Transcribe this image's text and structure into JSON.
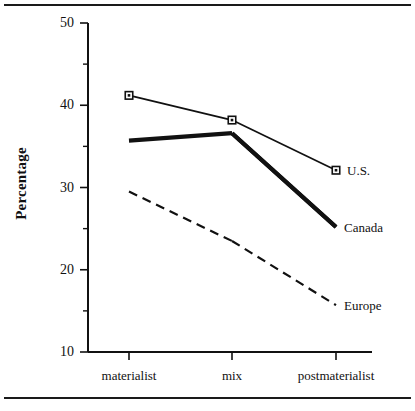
{
  "chart_data": {
    "type": "line",
    "title": "",
    "subtitle": "",
    "xlabel": "",
    "ylabel": "Percentage",
    "categories": [
      "materialist",
      "mix",
      "postmaterialist"
    ],
    "ylim": [
      10,
      50
    ],
    "yticks": [
      10,
      20,
      30,
      40,
      50
    ],
    "ytick_labels": [
      "10",
      "20",
      "30",
      "40",
      "50"
    ],
    "yminor_ticks": [
      15,
      25,
      35,
      45
    ],
    "grid": false,
    "legend_position": "right-inline",
    "series": [
      {
        "name": "U.S.",
        "values": [
          41.2,
          38.2,
          32.1
        ],
        "style": "thin-solid",
        "marker": "open-square",
        "color": "#111111"
      },
      {
        "name": "Canada",
        "values": [
          35.7,
          36.6,
          25.2
        ],
        "style": "thick-solid",
        "marker": "none",
        "color": "#111111"
      },
      {
        "name": "Europe",
        "values": [
          29.5,
          23.5,
          15.7
        ],
        "style": "dashed",
        "marker": "none",
        "color": "#111111"
      }
    ]
  },
  "axes": {
    "y_label": "Percentage",
    "y_tick_labels": [
      "50",
      "40",
      "30",
      "20",
      "10"
    ],
    "x_tick_labels": [
      "materialist",
      "mix",
      "postmaterialist"
    ]
  },
  "legend": {
    "items": [
      {
        "label": "U.S."
      },
      {
        "label": "Canada"
      },
      {
        "label": "Europe"
      }
    ]
  },
  "colors": {
    "ink": "#111111",
    "rule": "#1a1a1a",
    "background": "#ffffff"
  }
}
